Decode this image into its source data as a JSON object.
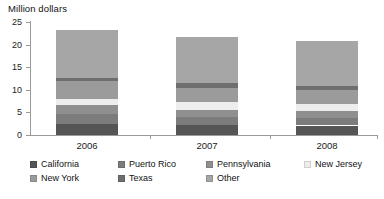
{
  "chart_data": {
    "type": "bar",
    "title": "Million dollars",
    "subtitle": "",
    "xlabel": "",
    "ylabel": "Million dollars",
    "categories": [
      "2006",
      "2007",
      "2008"
    ],
    "ylim": [
      0,
      25
    ],
    "yticks": [
      0,
      5,
      10,
      15,
      20,
      25
    ],
    "grid": false,
    "stacked": true,
    "legend_position": "bottom",
    "series": [
      {
        "name": "California",
        "color": "#555555",
        "values": [
          2.5,
          2.2,
          2.1
        ]
      },
      {
        "name": "Puerto Rico",
        "color": "#7c7c7c",
        "values": [
          2.2,
          1.8,
          1.7
        ]
      },
      {
        "name": "Pennsylvania",
        "color": "#8f8f8f",
        "values": [
          1.9,
          1.6,
          1.6
        ]
      },
      {
        "name": "New Jersey",
        "color": "#ededed",
        "values": [
          1.3,
          1.7,
          1.4
        ]
      },
      {
        "name": "New York",
        "color": "#9b9b9b",
        "values": [
          4.0,
          3.2,
          3.2
        ]
      },
      {
        "name": "Texas",
        "color": "#6e6e6e",
        "values": [
          0.8,
          0.9,
          0.9
        ]
      },
      {
        "name": "Other",
        "color": "#a6a6a6",
        "values": [
          10.6,
          10.3,
          9.9
        ]
      }
    ],
    "totals": [
      23.3,
      21.7,
      20.8
    ],
    "annotations": []
  },
  "axis": {
    "title": "Million dollars",
    "tick_labels": [
      "25",
      "20",
      "15",
      "10",
      "5",
      "0"
    ]
  },
  "categories": {
    "labels": [
      "2006",
      "2007",
      "2008"
    ]
  },
  "legend": {
    "entries": [
      {
        "label": "California",
        "color": "#555555"
      },
      {
        "label": "Puerto Rico",
        "color": "#7c7c7c"
      },
      {
        "label": "Pennsylvania",
        "color": "#8f8f8f"
      },
      {
        "label": "New Jersey",
        "color": "#ededed"
      },
      {
        "label": "New York",
        "color": "#9b9b9b"
      },
      {
        "label": "Texas",
        "color": "#6e6e6e"
      },
      {
        "label": "Other",
        "color": "#a6a6a6"
      }
    ]
  }
}
